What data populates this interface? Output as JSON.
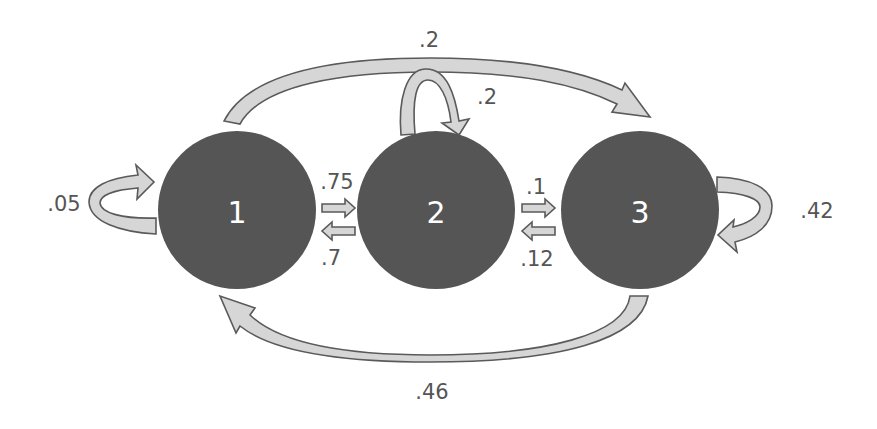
{
  "diagram": {
    "type": "markov-chain-state-transition",
    "colors": {
      "node_fill": "#555555",
      "node_label": "#ffffff",
      "arrow_fill": "#d6d6d6",
      "arrow_stroke": "#5a5a5a",
      "text": "#555555"
    },
    "nodes": [
      {
        "id": "1",
        "label": "1"
      },
      {
        "id": "2",
        "label": "2"
      },
      {
        "id": "3",
        "label": "3"
      }
    ],
    "edges": [
      {
        "from": "1",
        "to": "1",
        "label": ".05"
      },
      {
        "from": "1",
        "to": "2",
        "label": ".75"
      },
      {
        "from": "2",
        "to": "1",
        "label": ".7"
      },
      {
        "from": "1",
        "to": "3",
        "label": ".2"
      },
      {
        "from": "2",
        "to": "2",
        "label": ".2"
      },
      {
        "from": "2",
        "to": "3",
        "label": ".1"
      },
      {
        "from": "3",
        "to": "2",
        "label": ".12"
      },
      {
        "from": "3",
        "to": "3",
        "label": ".42"
      },
      {
        "from": "3",
        "to": "1",
        "label": ".46"
      }
    ]
  }
}
